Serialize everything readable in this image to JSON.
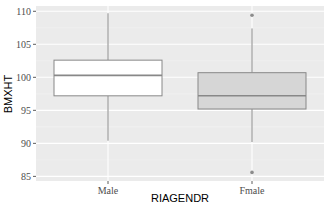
{
  "chart_data": {
    "type": "box",
    "title": "",
    "xlabel": "RIAGENDR",
    "ylabel": "BMXHT",
    "categories": [
      "Male",
      "Fmale"
    ],
    "ylim": [
      84.3,
      110.8
    ],
    "yticks": [
      85,
      90,
      95,
      100,
      105,
      110
    ],
    "grid": true,
    "legend": null,
    "series": [
      {
        "name": "Male",
        "whisker_low": 90.4,
        "q1": 97.2,
        "median": 100.3,
        "q3": 102.6,
        "whisker_high": 109.7,
        "outliers": [],
        "fill": "#ffffff"
      },
      {
        "name": "Fmale",
        "whisker_low": 90.2,
        "q1": 95.2,
        "median": 97.2,
        "q3": 100.7,
        "whisker_high": 107.4,
        "outliers": [
          109.4,
          85.6
        ],
        "fill": "#d6d6d6"
      }
    ],
    "colors": {
      "panel_bg": "#ebebeb",
      "grid_major": "#ffffff",
      "grid_minor": "#f4f4f4",
      "box_line": "#888888",
      "outlier": "#8c8c8c"
    }
  }
}
